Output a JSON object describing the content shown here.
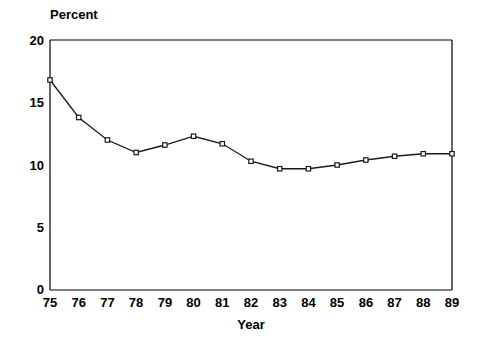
{
  "chart_data": {
    "type": "line",
    "title": "",
    "xlabel": "Year",
    "ylabel": "Percent",
    "ylabel_position": "top-left",
    "x": [
      "75",
      "76",
      "77",
      "78",
      "79",
      "80",
      "81",
      "82",
      "83",
      "84",
      "85",
      "86",
      "87",
      "88",
      "89"
    ],
    "x_full_years": [
      1975,
      1976,
      1977,
      1978,
      1979,
      1980,
      1981,
      1982,
      1983,
      1984,
      1985,
      1986,
      1987,
      1988,
      1989
    ],
    "values": [
      16.8,
      13.8,
      12.0,
      11.0,
      11.6,
      12.3,
      11.7,
      10.3,
      9.7,
      9.7,
      10.0,
      10.4,
      10.7,
      10.9,
      10.9
    ],
    "series": [
      {
        "name": "Percent",
        "values": [
          16.8,
          13.8,
          12.0,
          11.0,
          11.6,
          12.3,
          11.7,
          10.3,
          9.7,
          9.7,
          10.0,
          10.4,
          10.7,
          10.9,
          10.9
        ]
      }
    ],
    "xlim": [
      75,
      89
    ],
    "ylim": [
      0,
      20
    ],
    "ytick_labels": [
      "20",
      "15",
      "10",
      "5",
      "0"
    ],
    "ytick_values": [
      20,
      15,
      10,
      5,
      0
    ],
    "xtick_labels": [
      "75",
      "76",
      "77",
      "78",
      "79",
      "80",
      "81",
      "82",
      "83",
      "84",
      "85",
      "86",
      "87",
      "88",
      "89"
    ],
    "grid": false,
    "legend": "none",
    "marker": "open-square",
    "line_color": "#1a1a1a",
    "marker_fill": "#ffffff",
    "frame_color": "#000000",
    "background_color": "#ffffff"
  }
}
